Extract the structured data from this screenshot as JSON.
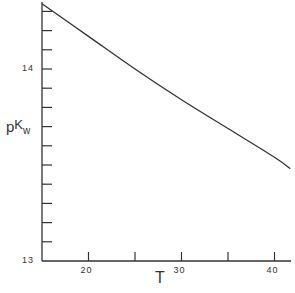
{
  "chart_data": {
    "type": "line",
    "title": "",
    "xlabel": "T",
    "ylabel": "pKw",
    "ylabel_parts": {
      "p": "p",
      "K": "K",
      "sub": "w"
    },
    "xlim": [
      15,
      41.7
    ],
    "ylim": [
      13.0,
      14.35
    ],
    "x_ticks_major": [
      20,
      30,
      40
    ],
    "x_ticks_minor": [
      25,
      35
    ],
    "x_tick_labels": [
      "20",
      "30",
      "40"
    ],
    "y_ticks": [
      13.0,
      13.1,
      13.2,
      13.3,
      13.4,
      13.5,
      13.6,
      13.7,
      13.8,
      13.9,
      14.0,
      14.1,
      14.2,
      14.3
    ],
    "y_tick_labels": {
      "13.0": "13",
      "14.0": "14"
    },
    "grid": false,
    "legend": null,
    "series": [
      {
        "name": "pKw",
        "x": [
          15,
          20,
          25,
          30,
          35,
          40,
          41.7
        ],
        "values": [
          14.34,
          14.17,
          14.0,
          13.84,
          13.69,
          13.54,
          13.48
        ]
      }
    ]
  }
}
